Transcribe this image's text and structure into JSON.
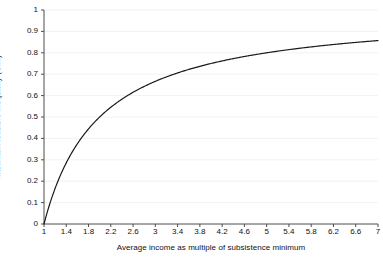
{
  "chart_data": {
    "type": "line",
    "title": "",
    "xlabel": "Average income as multiple of subsistence minimum",
    "ylabel": "Maximum feasible inequality (Gini)",
    "xlim": [
      1,
      7
    ],
    "ylim": [
      0,
      1
    ],
    "grid": true,
    "grid_axis": "y",
    "legend": "none",
    "line_color": "#1a1a1a",
    "grid_color": "#f2f2f2",
    "axis_color": "#4d4d4d",
    "background": "#ffffff",
    "xticks": [
      "1",
      "1.4",
      "1.8",
      "2.2",
      "2.6",
      "3",
      "3.4",
      "3.8",
      "4.2",
      "4.6",
      "5",
      "5.4",
      "5.8",
      "6.2",
      "6.6",
      "7"
    ],
    "xtick_values": [
      1,
      1.4,
      1.8,
      2.2,
      2.6,
      3,
      3.4,
      3.8,
      4.2,
      4.6,
      5,
      5.4,
      5.8,
      6.2,
      6.6,
      7
    ],
    "yticks": [
      "0",
      "0.1",
      "0.2",
      "0.3",
      "0.4",
      "0.5",
      "0.6",
      "0.7",
      "0.8",
      "0.9",
      "1"
    ],
    "ytick_values": [
      0,
      0.1,
      0.2,
      0.3,
      0.4,
      0.5,
      0.6,
      0.7,
      0.8,
      0.9,
      1
    ],
    "series": [
      {
        "name": "Maximum feasible inequality",
        "formula": "G = (alpha - 1) / alpha",
        "x": [
          1,
          1.1,
          1.2,
          1.3,
          1.4,
          1.5,
          1.6,
          1.7,
          1.8,
          1.9,
          2,
          2.2,
          2.4,
          2.6,
          2.8,
          3,
          3.2,
          3.4,
          3.6,
          3.8,
          4,
          4.2,
          4.4,
          4.6,
          4.8,
          5,
          5.2,
          5.4,
          5.6,
          5.8,
          6,
          6.2,
          6.4,
          6.6,
          6.8,
          7
        ],
        "values": [
          0,
          0.091,
          0.167,
          0.231,
          0.286,
          0.333,
          0.375,
          0.412,
          0.444,
          0.474,
          0.5,
          0.545,
          0.583,
          0.615,
          0.643,
          0.667,
          0.688,
          0.706,
          0.722,
          0.737,
          0.75,
          0.762,
          0.773,
          0.783,
          0.792,
          0.8,
          0.808,
          0.815,
          0.821,
          0.828,
          0.833,
          0.839,
          0.844,
          0.848,
          0.853,
          0.857
        ]
      }
    ]
  }
}
